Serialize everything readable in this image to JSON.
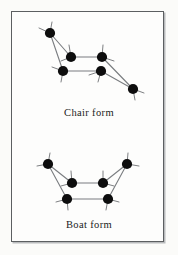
{
  "figure": {
    "background_color": "#fbfbf9",
    "frame_color": "#5c5f61",
    "atom_color": "#0d0d0d",
    "bond_color": "#6e7174",
    "ring_bond_color": "#7a7d80"
  },
  "captions": {
    "chair": "Chair form",
    "boat": "Boat form"
  },
  "chart_data": {
    "type": "diagram",
    "title": "",
    "subtitle": "",
    "panels": [
      {
        "id": "chair",
        "label": "Chair form",
        "ring_atom_count": 6,
        "atoms": [
          {
            "id": "C1",
            "x": 50,
            "y": 33
          },
          {
            "id": "C2",
            "x": 71,
            "y": 57
          },
          {
            "id": "C3",
            "x": 102,
            "y": 57
          },
          {
            "id": "C4",
            "x": 133,
            "y": 89
          },
          {
            "id": "C5",
            "x": 101,
            "y": 71
          },
          {
            "id": "C6",
            "x": 63,
            "y": 71
          }
        ],
        "ring_bonds": [
          [
            "C1",
            "C2"
          ],
          [
            "C2",
            "C3"
          ],
          [
            "C3",
            "C4"
          ],
          [
            "C4",
            "C5"
          ],
          [
            "C5",
            "C6"
          ],
          [
            "C6",
            "C1"
          ]
        ],
        "substituent_stubs": [
          {
            "atom": "C1",
            "dx": -11,
            "dy": -5
          },
          {
            "atom": "C1",
            "dx": 2,
            "dy": -11
          },
          {
            "atom": "C2",
            "dx": -2,
            "dy": -12
          },
          {
            "atom": "C2",
            "dx": -10,
            "dy": 4
          },
          {
            "atom": "C3",
            "dx": 1,
            "dy": -12
          },
          {
            "atom": "C3",
            "dx": 12,
            "dy": 4
          },
          {
            "atom": "C4",
            "dx": 11,
            "dy": 4
          },
          {
            "atom": "C4",
            "dx": 2,
            "dy": 11
          },
          {
            "atom": "C5",
            "dx": -12,
            "dy": 4
          },
          {
            "atom": "C5",
            "dx": -3,
            "dy": 11
          },
          {
            "atom": "C6",
            "dx": -11,
            "dy": -4
          },
          {
            "atom": "C6",
            "dx": -2,
            "dy": 11
          }
        ]
      },
      {
        "id": "boat",
        "label": "Boat form",
        "ring_atom_count": 6,
        "atoms": [
          {
            "id": "C1",
            "x": 48,
            "y": 164
          },
          {
            "id": "C2",
            "x": 72,
            "y": 183
          },
          {
            "id": "C3",
            "x": 103,
            "y": 183
          },
          {
            "id": "C4",
            "x": 127,
            "y": 164
          },
          {
            "id": "C5",
            "x": 108,
            "y": 199
          },
          {
            "id": "C6",
            "x": 67,
            "y": 199
          }
        ],
        "ring_bonds": [
          [
            "C1",
            "C2"
          ],
          [
            "C2",
            "C3"
          ],
          [
            "C3",
            "C4"
          ],
          [
            "C4",
            "C5"
          ],
          [
            "C5",
            "C6"
          ],
          [
            "C6",
            "C1"
          ]
        ],
        "substituent_stubs": [
          {
            "atom": "C1",
            "dx": -11,
            "dy": 2
          },
          {
            "atom": "C1",
            "dx": 2,
            "dy": -11
          },
          {
            "atom": "C2",
            "dx": -1,
            "dy": -12
          },
          {
            "atom": "C2",
            "dx": -11,
            "dy": 3
          },
          {
            "atom": "C3",
            "dx": 0,
            "dy": -12
          },
          {
            "atom": "C3",
            "dx": 11,
            "dy": 3
          },
          {
            "atom": "C4",
            "dx": 12,
            "dy": 2
          },
          {
            "atom": "C4",
            "dx": 1,
            "dy": -11
          },
          {
            "atom": "C5",
            "dx": 11,
            "dy": 3
          },
          {
            "atom": "C5",
            "dx": -2,
            "dy": 11
          },
          {
            "atom": "C6",
            "dx": -11,
            "dy": 3
          },
          {
            "atom": "C6",
            "dx": 1,
            "dy": 11
          }
        ]
      }
    ]
  }
}
